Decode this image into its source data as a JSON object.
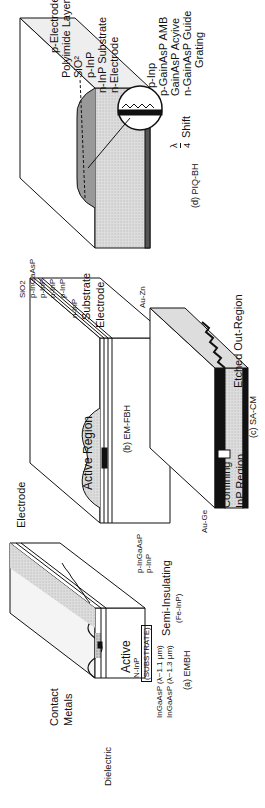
{
  "figure": {
    "rotation": "90deg counter-clockwise",
    "panels": [
      {
        "id": "a",
        "caption": "(a) EMBH",
        "labels": {
          "dielectric": "Dielectric",
          "contact_metals_1": "Contact",
          "contact_metals_2": "Metals",
          "active": "Active",
          "substrate_1": "N-InP",
          "substrate_2": "(SUBSTRATE)",
          "p_ingaasp": "p-InGaAsP",
          "p_inp": "p-InP",
          "semi_insulating": "Semi-Insulating",
          "fe_inp": "(Fe-InP)",
          "ingaasp_11": "InGaAsP (λ~1.1 μm)",
          "ingaasp_13": "InGaAsP (λ~1.3 μm)"
        }
      },
      {
        "id": "b",
        "caption": "(b) EM-FBH",
        "labels": {
          "electrode_top": "Electrode",
          "active_region": "Active Region",
          "sio2": "SiO2",
          "p_ingaasp": "p-InGaAsP",
          "p_inp_1": "p-InP",
          "n_inp_1": "n-InP",
          "p_inp_2": "p-InP",
          "n_inp_2": "n-InP",
          "substrate": "Substrate",
          "electrode_bottom": "Electrode"
        }
      },
      {
        "id": "c",
        "caption": "(c) SA-CM",
        "labels": {
          "au_zn": "Au-Zn",
          "au_ge": "Au-Ge",
          "confining_1": "Confining",
          "confining_2": "InP Region",
          "etched": "Etched Out-Region"
        }
      },
      {
        "id": "d",
        "caption": "(d) PIQ-BH",
        "labels": {
          "p_electrode": "p-Electrode",
          "polyimide": "Polyimide Layer",
          "sio2": "SiO²",
          "p_inp": "p-InP",
          "n_inp_sub": "n-InP Substrate",
          "n_electrode": "n-Electrode",
          "inset_p_inp": "p-Inp",
          "inset_p_gainasp": "p-GainAsP AMB",
          "inset_active": "GainAsP Acyive",
          "inset_guide": "n-GainAsP Guide",
          "inset_grating": "Grating",
          "shift_num": "λ",
          "shift_den": "4",
          "shift_text": "Shift"
        }
      }
    ]
  }
}
